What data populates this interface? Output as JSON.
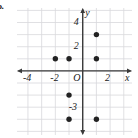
{
  "problem": {
    "label": "b."
  },
  "chart_data": {
    "type": "scatter",
    "title": "",
    "xlabel": "x",
    "ylabel": "y",
    "xlim": [
      -4.8,
      3.6
    ],
    "ylim": [
      -5.3,
      5.2
    ],
    "grid": true,
    "grid_step": 1,
    "legend": null,
    "x_tick_labels": [
      "-4",
      "-2",
      "O",
      "2"
    ],
    "x_tick_values": [
      -4,
      -2,
      0,
      2
    ],
    "y_tick_labels": [
      "4",
      "2",
      "-3"
    ],
    "y_tick_values": [
      4,
      2,
      -3
    ],
    "origin_label": "O",
    "points": [
      {
        "x": -2,
        "y": 1
      },
      {
        "x": -1,
        "y": 1
      },
      {
        "x": 1,
        "y": 1
      },
      {
        "x": 1,
        "y": 3
      },
      {
        "x": -1,
        "y": -2
      },
      {
        "x": -1,
        "y": -4
      },
      {
        "x": 1,
        "y": -4
      }
    ],
    "point_color": "#222222",
    "axis_color": "#3a3a3a",
    "grid_color": "#d8d8dc"
  }
}
